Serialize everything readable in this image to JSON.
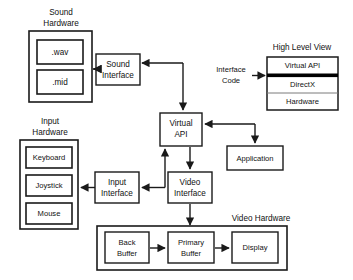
{
  "diagram": {
    "background_color": "#ffffff",
    "line_color": "#1a1a1a",
    "box_fill": "#ffffff",
    "groups": [
      {
        "id": "sound-hardware",
        "label_line1": "Sound",
        "label_line2": "Hardware"
      },
      {
        "id": "input-hardware",
        "label_line1": "Input",
        "label_line2": "Hardware"
      },
      {
        "id": "high-level-view",
        "label_line1": "High Level View",
        "label_line2": ""
      },
      {
        "id": "video-hardware",
        "label_line1": "Video Hardware",
        "label_line2": ""
      }
    ],
    "nodes": {
      "wav": {
        "label": "wav",
        "display": ".wav"
      },
      "mid": {
        "label": "mid",
        "display": ".mid"
      },
      "sound_interface": {
        "line1": "Sound",
        "line2": "Interface"
      },
      "keyboard": {
        "label": "Keyboard"
      },
      "joystick": {
        "label": "Joystick"
      },
      "mouse": {
        "label": "Mouse"
      },
      "input_interface": {
        "line1": "Input",
        "line2": "Interface"
      },
      "virtual_api": {
        "line1": "Virtual",
        "line2": "API"
      },
      "video_interface": {
        "line1": "Video",
        "line2": "Interface"
      },
      "application": {
        "label": "Application"
      },
      "hlv_virtual_api": {
        "label": "Virtual API"
      },
      "hlv_directx": {
        "label": "DirectX"
      },
      "hlv_hardware": {
        "label": "Hardware"
      },
      "back_buffer": {
        "line1": "Back",
        "line2": "Buffer"
      },
      "primary_buffer": {
        "line1": "Primary",
        "line2": "Buffer"
      },
      "display": {
        "label": "Display"
      }
    },
    "annotations": {
      "interface_code": {
        "line1": "Interface",
        "line2": "Code"
      }
    },
    "edges": [
      {
        "from": "virtual_api",
        "to": "sound_interface",
        "label": ""
      },
      {
        "from": "sound_interface",
        "to": "sound_hardware",
        "label": ""
      },
      {
        "from": "branch",
        "to": "virtual_api",
        "label": ""
      },
      {
        "from": "virtual_api",
        "to": "video_interface",
        "label": ""
      },
      {
        "from": "video_interface",
        "to": "input_interface",
        "label": ""
      },
      {
        "from": "input_interface",
        "to": "input_hardware",
        "label": ""
      },
      {
        "from": "video_interface",
        "to": "primary_buffer",
        "label": ""
      },
      {
        "from": "back_buffer",
        "to": "primary_buffer",
        "label": ""
      },
      {
        "from": "primary_buffer",
        "to": "display",
        "label": ""
      },
      {
        "from": "application_branch",
        "to": "application",
        "label": ""
      },
      {
        "from": "interface_code",
        "to": "hlv_divider",
        "label": ""
      }
    ]
  }
}
